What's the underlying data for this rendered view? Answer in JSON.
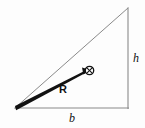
{
  "figure": {
    "kind": "geometry-diagram",
    "background_color": "#fdfdfd",
    "outline_color": "#8a8a8a",
    "vector_color": "#111111",
    "label_color": "#111111",
    "width": 145,
    "height": 128
  },
  "triangle": {
    "name": "right-triangle",
    "vertices": {
      "left": {
        "x": 15,
        "y": 108
      },
      "top_right": {
        "x": 128,
        "y": 8
      },
      "bottom_right": {
        "x": 128,
        "y": 108
      }
    },
    "sides": {
      "base": {
        "name": "base-side",
        "from": "left",
        "to": "bottom_right"
      },
      "height": {
        "name": "height-side",
        "from": "bottom_right",
        "to": "top_right"
      },
      "hypotenuse": {
        "name": "hypotenuse-side",
        "from": "left",
        "to": "top_right"
      }
    },
    "stroke_width": 1
  },
  "vector": {
    "name": "resultant-vector-R",
    "label": "R",
    "from": {
      "x": 15,
      "y": 108
    },
    "to": {
      "x": 88,
      "y": 71
    },
    "tail_width": 4.2,
    "head_width": 1.6,
    "color": "#111111"
  },
  "marker": {
    "name": "circled-cross-marker",
    "glyph": "circled-cross",
    "center": {
      "x": 89.5,
      "y": 70.5
    },
    "radius": 4.2,
    "stroke_width": 1.2,
    "color": "#111111"
  },
  "labels": {
    "height": "h",
    "base": "b",
    "vector": "R"
  }
}
